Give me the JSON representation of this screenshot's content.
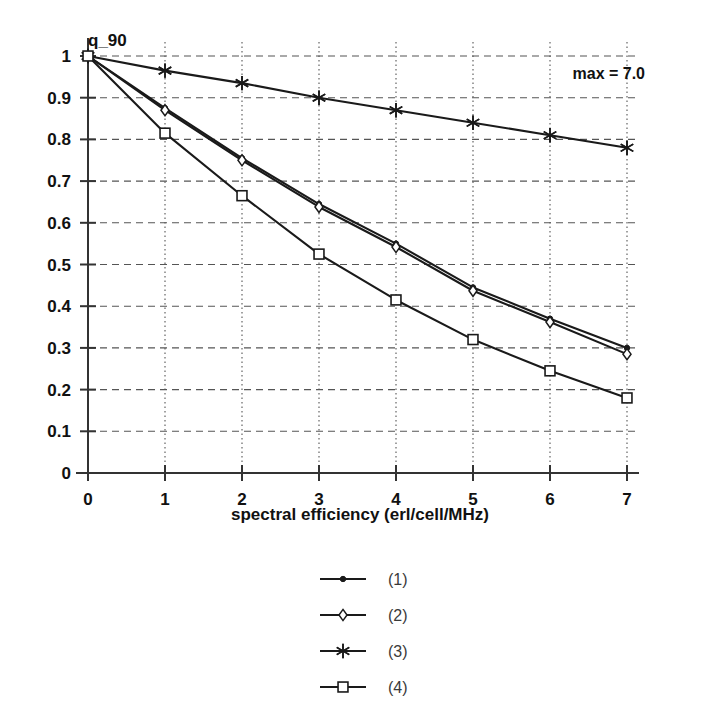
{
  "chart_data": {
    "type": "line",
    "title": "",
    "ylabel": "q_90",
    "xlabel": "spectral efficiency (erl/cell/MHz)",
    "xlim": [
      0,
      7
    ],
    "ylim": [
      0,
      1
    ],
    "xticks": [
      "0",
      "1",
      "2",
      "3",
      "4",
      "5",
      "6",
      "7"
    ],
    "yticks": [
      "0",
      "0.1",
      "0.2",
      "0.3",
      "0.4",
      "0.5",
      "0.6",
      "0.7",
      "0.8",
      "0.9",
      "1"
    ],
    "grid": "both",
    "legend_position": "below-center",
    "annotation": "max = 7.0",
    "x": [
      0,
      1,
      2,
      3,
      4,
      5,
      6,
      7
    ],
    "series": [
      {
        "name": "(1)",
        "marker": "dot",
        "values": [
          1.0,
          0.875,
          0.755,
          0.645,
          0.55,
          0.445,
          0.37,
          0.3
        ]
      },
      {
        "name": "(2)",
        "marker": "diamond",
        "values": [
          1.0,
          0.87,
          0.75,
          0.638,
          0.542,
          0.437,
          0.362,
          0.285
        ]
      },
      {
        "name": "(3)",
        "marker": "star",
        "values": [
          1.0,
          0.965,
          0.935,
          0.9,
          0.87,
          0.84,
          0.81,
          0.78
        ]
      },
      {
        "name": "(4)",
        "marker": "square",
        "values": [
          1.0,
          0.815,
          0.665,
          0.525,
          0.415,
          0.32,
          0.245,
          0.18
        ]
      }
    ],
    "colors": {
      "line": "#1a1a1a",
      "grid": "#555555",
      "axis": "#333333",
      "background": "#ffffff"
    }
  }
}
